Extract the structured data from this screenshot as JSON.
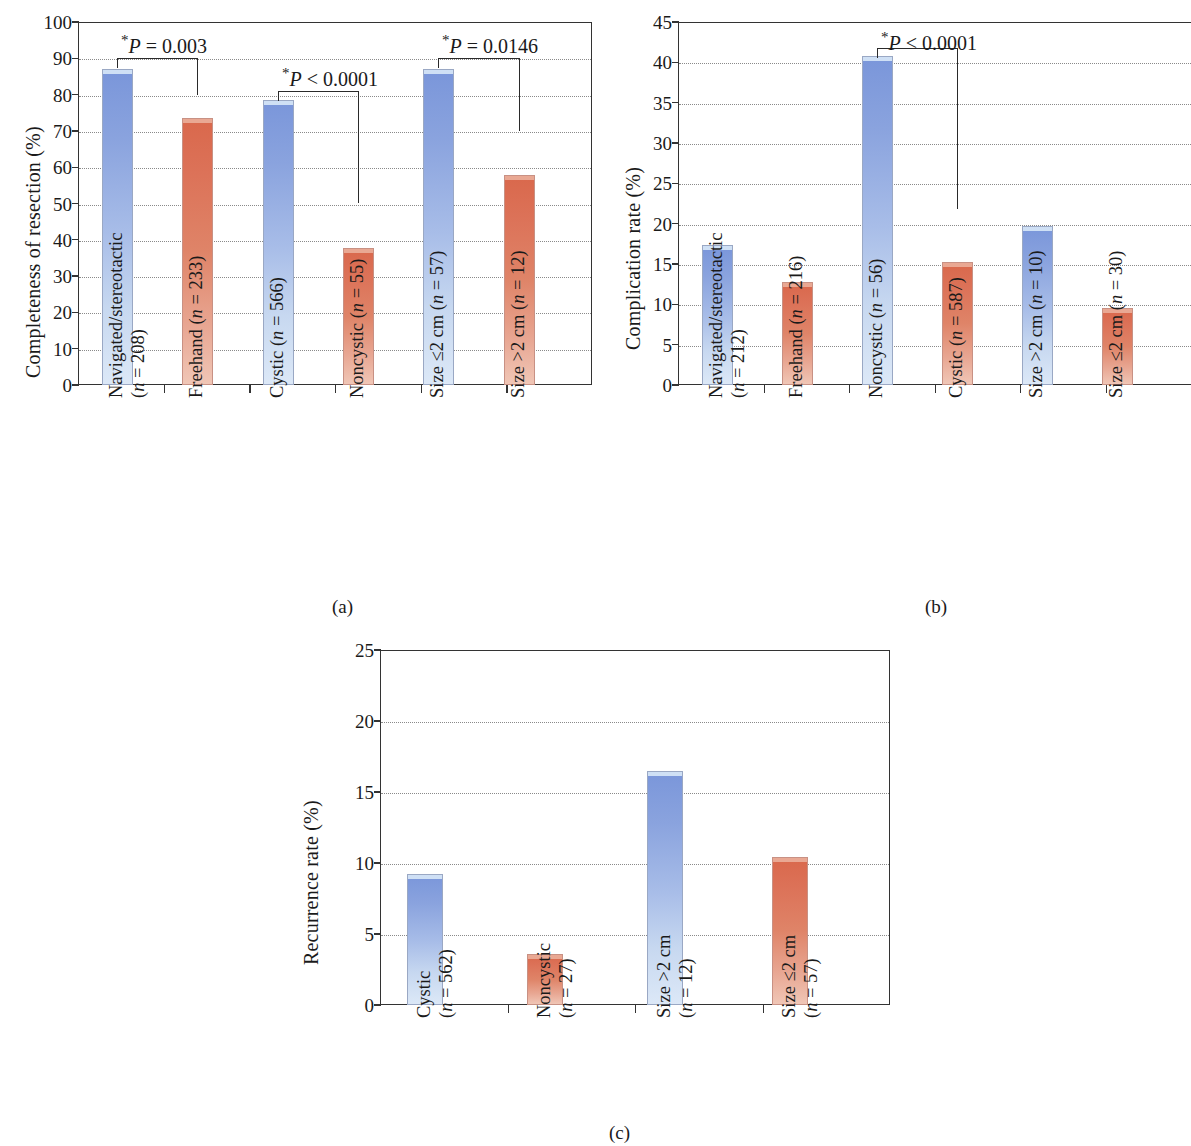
{
  "figure": {
    "panel_captions": [
      "(a)",
      "(b)",
      "(c)"
    ]
  },
  "chart_data": [
    {
      "type": "bar",
      "panel": "(a)",
      "title": "",
      "xlabel": "",
      "ylabel": "Completeness of resection (%)",
      "ylim": [
        0,
        100
      ],
      "yticks": [
        0,
        10,
        20,
        30,
        40,
        50,
        60,
        70,
        80,
        90,
        100
      ],
      "grid": true,
      "legend": "none",
      "categories": [
        {
          "line1": "Navigated/stereotactic",
          "line2": "(n = 208)"
        },
        {
          "line1": "Freehand (n = 233)",
          "line2": ""
        },
        {
          "line1": "Cystic (n = 566)",
          "line2": ""
        },
        {
          "line1": "Noncystic (n = 55)",
          "line2": ""
        },
        {
          "line1": "Size ≤2 cm (n = 57)",
          "line2": ""
        },
        {
          "line1": "Size >2 cm (n = 12)",
          "line2": ""
        }
      ],
      "values": [
        87.0,
        73.5,
        78.5,
        37.8,
        87.0,
        57.8
      ],
      "colors": [
        "blue",
        "red",
        "blue",
        "red",
        "blue",
        "red"
      ],
      "annotations": [
        {
          "text": "P = 0.003",
          "star": "*",
          "from": 0,
          "to": 1,
          "label_y": 97,
          "bar_y": 90,
          "drop_to": 80
        },
        {
          "text": "P < 0.0001",
          "star": "*",
          "from": 2,
          "to": 3,
          "label_y": 88,
          "bar_y": 81,
          "drop_to": 50
        },
        {
          "text": "P = 0.0146",
          "star": "*",
          "from": 4,
          "to": 5,
          "label_y": 97,
          "bar_y": 90,
          "drop_to": 70
        }
      ]
    },
    {
      "type": "bar",
      "panel": "(b)",
      "title": "",
      "xlabel": "",
      "ylabel": "Complication rate (%)",
      "ylim": [
        0,
        45
      ],
      "yticks": [
        0,
        5,
        10,
        15,
        20,
        25,
        30,
        35,
        40,
        45
      ],
      "grid": true,
      "legend": "none",
      "categories": [
        {
          "line1": "Navigated/stereotactic",
          "line2": "(n = 212)"
        },
        {
          "line1": "Freehand (n = 216)",
          "line2": ""
        },
        {
          "line1": "Noncystic (n = 56)",
          "line2": ""
        },
        {
          "line1": "Cystic (n = 587)",
          "line2": ""
        },
        {
          "line1": "Size >2 cm (n = 10)",
          "line2": ""
        },
        {
          "line1": "Size ≤2 cm (n = 30)",
          "line2": ""
        }
      ],
      "values": [
        17.3,
        12.8,
        40.8,
        15.2,
        19.7,
        9.6
      ],
      "colors": [
        "blue",
        "red",
        "blue",
        "red",
        "blue",
        "red"
      ],
      "annotations": [
        {
          "text": "P < 0.0001",
          "star": "*",
          "from": 2,
          "to": 3,
          "label_y": 44.0,
          "bar_y": 41.8,
          "drop_to": 21.8
        }
      ]
    },
    {
      "type": "bar",
      "panel": "(c)",
      "title": "",
      "xlabel": "",
      "ylabel": "Recurrence rate (%)",
      "ylim": [
        0,
        25
      ],
      "yticks": [
        0,
        5,
        10,
        15,
        20,
        25
      ],
      "grid": true,
      "legend": "none",
      "categories": [
        {
          "line1": "Cystic",
          "line2": "(n = 562)"
        },
        {
          "line1": "Noncystic",
          "line2": "(n = 27)"
        },
        {
          "line1": "Size >2 cm",
          "line2": "(n = 12)"
        },
        {
          "line1": "Size ≤2 cm",
          "line2": "(n = 57)"
        }
      ],
      "values": [
        9.2,
        3.6,
        16.5,
        10.4
      ],
      "colors": [
        "blue",
        "red",
        "blue",
        "red"
      ],
      "annotations": []
    }
  ],
  "colors": {
    "blue_top": "#7a96da",
    "blue_bottom": "#dce8f7",
    "red_top": "#d9684c",
    "red_bottom": "#f0c6b6",
    "axis": "#333333",
    "grid": "#8a8a8a",
    "text": "#1a1a1a"
  }
}
